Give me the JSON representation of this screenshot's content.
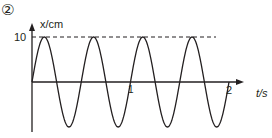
{
  "figure": {
    "label": "②"
  },
  "chart_data": {
    "type": "line",
    "title": "",
    "xlabel": "t/s",
    "ylabel": "x/cm",
    "x_ticks": [
      "1",
      "2"
    ],
    "y_ticks": [
      "10"
    ],
    "amplitude": 10,
    "period": 0.5,
    "function": "x = 10 sin(4πt)",
    "xlim": [
      0,
      2
    ],
    "ylim": [
      -10,
      10
    ],
    "dashed_reference_line": 10,
    "x": [
      0,
      0.125,
      0.25,
      0.375,
      0.5,
      0.625,
      0.75,
      0.875,
      1.0,
      1.125,
      1.25,
      1.375,
      1.5,
      1.625,
      1.75,
      1.875,
      2.0
    ],
    "values": [
      0,
      10,
      0,
      -10,
      0,
      10,
      0,
      -10,
      0,
      10,
      0,
      -10,
      0,
      10,
      0,
      -10,
      0
    ],
    "grid": false
  }
}
